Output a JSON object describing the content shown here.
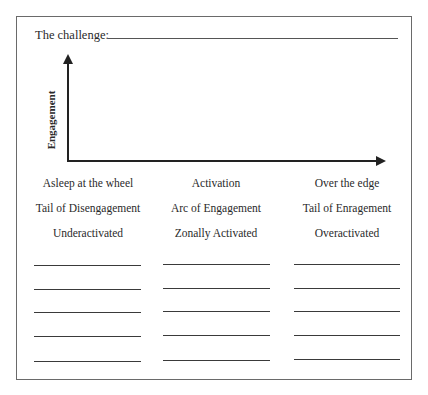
{
  "worksheet": {
    "title_label": "The challenge:",
    "y_axis_label": "Engagement",
    "columns": [
      {
        "heading": "Asleep at the wheel",
        "subheading": "Tail of Disengagement",
        "state": "Underactivated"
      },
      {
        "heading": "Activation",
        "subheading": "Arc of Engagement",
        "state": "Zonally Activated"
      },
      {
        "heading": "Over the edge",
        "subheading": "Tail of Enragement",
        "state": "Overactivated"
      }
    ],
    "blank_lines_per_column": 5
  }
}
